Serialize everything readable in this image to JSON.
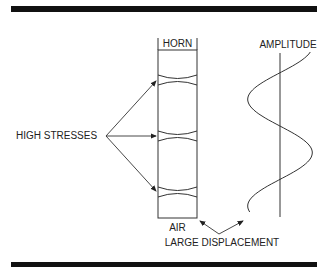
{
  "figure": {
    "labels": {
      "horn": "HORN",
      "air": "AIR",
      "amplitude": "AMPLITUDE",
      "high_stresses": "HIGH STRESSES",
      "large_displacement": "LARGE DISPLACEMENT"
    },
    "caption_visible_fragment": "",
    "colors": {
      "ink": "#222222",
      "rule": "#111111",
      "background": "#ffffff"
    }
  }
}
